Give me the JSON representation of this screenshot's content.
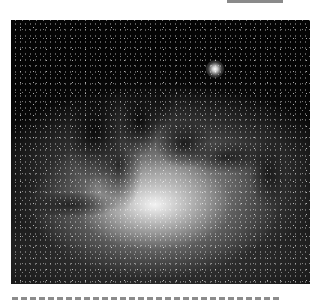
{
  "header": {
    "truncated_text": "— — — — — — — — —"
  },
  "figure": {
    "alt": "Grayscale photograph of the Milky Way galactic center with dark dust lanes and dense star fields",
    "colors": {
      "background": "#050505",
      "core_glow": "#ffffff",
      "rule": "#8c8c8c"
    }
  },
  "footer": {
    "rule_style": "dashed"
  }
}
